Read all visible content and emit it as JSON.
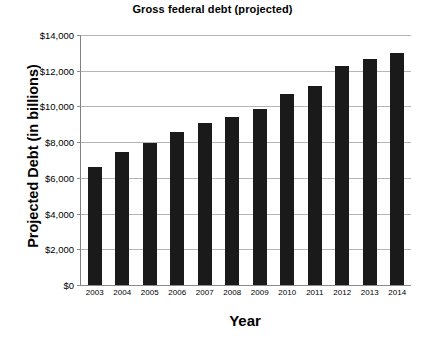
{
  "chart_data": {
    "type": "bar",
    "title": "Gross federal debt (projected)",
    "xlabel": "Year",
    "ylabel": "Projected Debt (in billions)",
    "categories": [
      "2003",
      "2004",
      "2005",
      "2006",
      "2007",
      "2008",
      "2009",
      "2010",
      "2011",
      "2012",
      "2013",
      "2014"
    ],
    "values": [
      6600,
      7450,
      7950,
      8590,
      9100,
      9430,
      9850,
      10700,
      11170,
      12260,
      12640,
      12980
    ],
    "ylim": [
      0,
      14000
    ],
    "ytick_labels": [
      "$0",
      "$2,000",
      "$4,000",
      "$6,000",
      "$8,000",
      "$10,000",
      "$12,000",
      "$14,000"
    ],
    "ytick_values": [
      0,
      2000,
      4000,
      6000,
      8000,
      10000,
      12000,
      14000
    ],
    "grid": true,
    "legend": "none",
    "bar_color": "#1a1a1a",
    "gridline_color": "#b5b5b5",
    "background": "#ffffff"
  }
}
